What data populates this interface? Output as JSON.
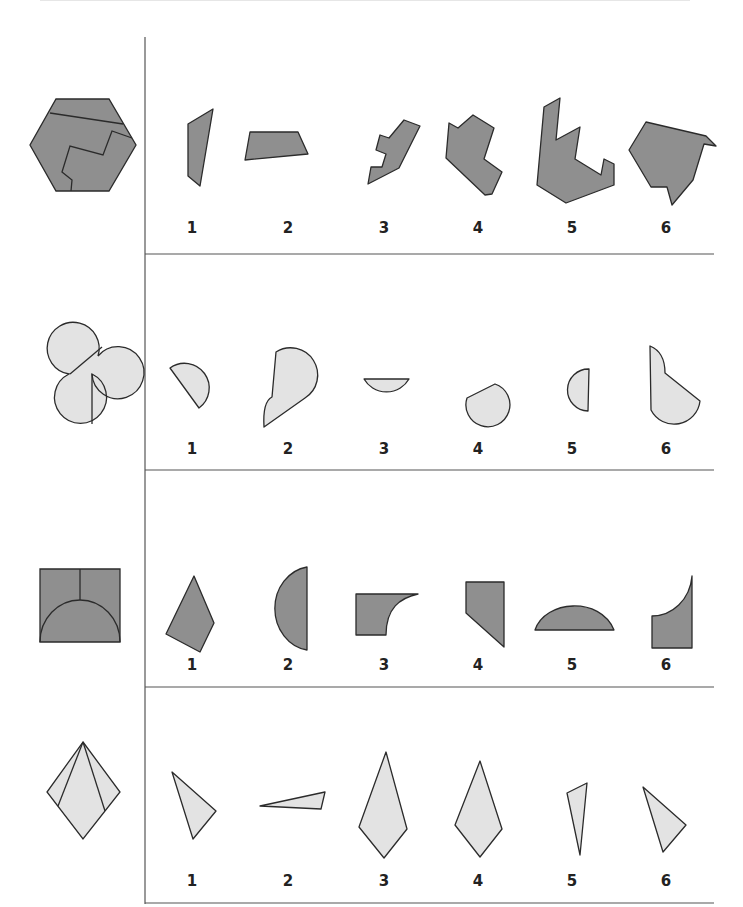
{
  "colors": {
    "dark_fill": "#8f8f8f",
    "light_fill": "#e3e3e3",
    "stroke": "#2b2b2b",
    "rule": "#555555"
  },
  "rows": [
    {
      "name": "hexagon-puzzle",
      "fill": "dark",
      "labels": [
        "1",
        "2",
        "3",
        "4",
        "5",
        "6"
      ],
      "label_y": 230,
      "divider_y": 254,
      "reference": {
        "outline": "M56,99 L109,99 L136,145 L109,191 L56,191 L30,145 Z",
        "cuts": [
          "M50,113 L123,124",
          "M132,138 L112,131 L103,155 L70,146 L62,172 L72,180 L71,191"
        ]
      },
      "options": [
        "M188,124 L213,109 L200,186 L188,176 Z",
        "M250,132 L298,132 L308,154 L245,160 Z",
        "M368,184 L371,167 L382,167 L386,154 L376,150 L380,135 L389,138 L404,120 L420,126 L399,168 Z",
        "M449,123 L458,128 L473,115 L494,128 L484,159 L502,172 L492,194 L485,195 L446,158 Z",
        "M560,98 L556,140 L580,127 L575,159 L601,175 L604,159 L614,164 L614,185 L566,203 L537,185 L544,107 Z",
        "M646,122 L706,136 L716,146 L704,144 L693,180 L672,205 L667,187 L651,187 L629,150 Z"
      ]
    },
    {
      "name": "figure-eight-puzzle",
      "fill": "light",
      "labels": [
        "1",
        "2",
        "3",
        "4",
        "5",
        "6"
      ],
      "label_y": 451,
      "divider_y": 470,
      "reference": {
        "outline": "M69,374 A26,26 0 1 1 98,356 A26,26 0 1 1 92,374 A26,26 0 1 1 69,374 Z",
        "cuts": [
          "M70,374 L102,347",
          "M92,374 L92,424"
        ]
      },
      "options": [
        "M170,368 A23,23 0 1 1 199,408 L170,368 Z",
        "M276,352 A25,25 0 0 1 305,398 L264,427 C263,410 266,400 272,397 Z",
        "M364,379 L409,379 A26,26 0 0 1 364,379 Z",
        "M467,398 A22,22 0 1 0 495,384 L467,398 Z",
        "M589,369 A20,20 0 0 0 588,411 Z",
        "M650,346 C660,350 665,360 665,373 L700,401 A26,26 0 0 1 651,410 Z"
      ]
    },
    {
      "name": "square-arch-puzzle",
      "fill": "dark",
      "labels": [
        "1",
        "2",
        "3",
        "4",
        "5",
        "6"
      ],
      "label_y": 667,
      "divider_y": 687,
      "reference": {
        "outline": "M40,569 L120,569 L120,642 L40,642 Z",
        "cuts": [
          "M80,569 L80,600",
          "M40,642 A40,42 0 0 1 120,642"
        ]
      },
      "options": [
        "M194,576 L214,623 L200,652 L166,634 Z",
        "M307,567 L307,650 A38,42 0 0 1 307,567 Z",
        "M356,594 L418,594 C400,598 386,608 386,635 L356,635 Z",
        "M466,582 L504,582 L504,647 L466,613 Z",
        "M535,630 C545,600 600,596 614,630 Z",
        "M692,576 L692,648 L652,648 L652,616 C672,616 690,600 692,576 Z"
      ]
    },
    {
      "name": "kite-puzzle",
      "fill": "light",
      "labels": [
        "1",
        "2",
        "3",
        "4",
        "5",
        "6"
      ],
      "label_y": 883,
      "divider_y": 903,
      "reference": {
        "outline": "M83,742 L120,792 L83,839 L47,792 Z",
        "cuts": [
          "M83,742 L58,806",
          "M83,742 L105,811"
        ]
      },
      "options": [
        "M172,772 L216,811 L193,839 Z",
        "M260,806 L325,792 L321,809 Z",
        "M386,752 L407,829 L384,858 L359,827 Z",
        "M480,761 L502,829 L480,857 L455,825 Z",
        "M587,783 L580,855 L567,793 Z",
        "M643,787 L686,825 L663,852 Z"
      ]
    }
  ],
  "columns_x": [
    192,
    288,
    384,
    478,
    572,
    666
  ]
}
